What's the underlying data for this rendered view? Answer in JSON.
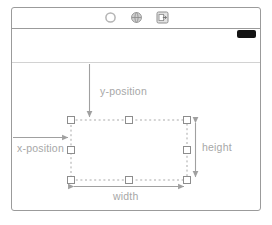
{
  "window": {
    "title": "",
    "toolbar": {
      "icons": [
        {
          "name": "circle-icon",
          "label": "ellipse-tool"
        },
        {
          "name": "globe-icon",
          "label": "globe-tool"
        },
        {
          "name": "export-icon",
          "label": "export-tool"
        }
      ]
    },
    "swatch": {
      "name": "black-pill-swatch",
      "color": "#131313"
    }
  },
  "diagram": {
    "type": "selection-box-annotation",
    "labels": {
      "y_position": "y-position",
      "x_position": "x-position",
      "height": "height",
      "width": "width"
    },
    "colors": {
      "frame_border": "#9b9b9b",
      "divider": "#d2d2d2",
      "label_text": "#a7a7a7",
      "arrow": "#a0a0a0",
      "dashed_box": "#a9a9a9",
      "handle_fill": "#ffffff",
      "handle_border": "#8d8d8d"
    },
    "selection_box": {
      "x": 71,
      "y": 120,
      "width": 116,
      "height": 60,
      "handles": 8
    },
    "measures": [
      {
        "name": "x-position",
        "orientation": "horizontal",
        "arrowheads": 1
      },
      {
        "name": "y-position",
        "orientation": "vertical",
        "arrowheads": 1
      },
      {
        "name": "width",
        "orientation": "horizontal",
        "arrowheads": 2
      },
      {
        "name": "height",
        "orientation": "vertical",
        "arrowheads": 2
      }
    ]
  }
}
